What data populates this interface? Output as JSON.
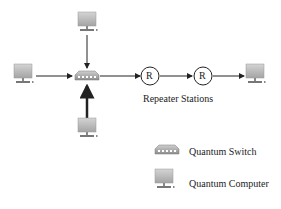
{
  "diagram": {
    "nodes": [
      {
        "id": "computer-top",
        "type": "quantum-computer"
      },
      {
        "id": "computer-left",
        "type": "quantum-computer"
      },
      {
        "id": "computer-bottom",
        "type": "quantum-computer"
      },
      {
        "id": "computer-right",
        "type": "quantum-computer"
      },
      {
        "id": "switch",
        "type": "quantum-switch"
      },
      {
        "id": "repeater-1",
        "type": "repeater",
        "label": "R"
      },
      {
        "id": "repeater-2",
        "type": "repeater",
        "label": "R"
      }
    ],
    "edges": [
      {
        "from": "computer-top",
        "to": "switch"
      },
      {
        "from": "computer-left",
        "to": "switch"
      },
      {
        "from": "computer-bottom",
        "to": "switch",
        "style": "thick"
      },
      {
        "from": "switch",
        "to": "repeater-1"
      },
      {
        "from": "repeater-1",
        "to": "repeater-2"
      },
      {
        "from": "repeater-2",
        "to": "computer-right"
      }
    ],
    "repeater_label": "R",
    "repeater_caption": "Repeater Stations"
  },
  "legend": {
    "items": [
      {
        "icon": "quantum-switch-icon",
        "label": "Quantum Switch"
      },
      {
        "icon": "quantum-computer-icon",
        "label": "Quantum Computer"
      }
    ]
  },
  "colors": {
    "line": "#222222",
    "device_gray": "#a8a8a8",
    "device_light": "#d0d0d0"
  }
}
